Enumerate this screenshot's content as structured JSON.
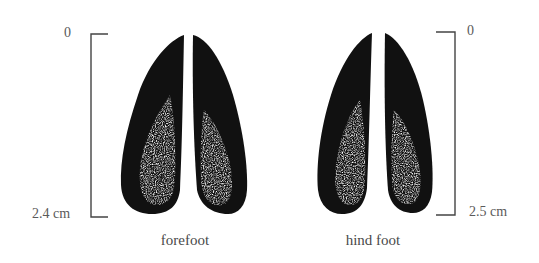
{
  "figure": {
    "forefoot": {
      "caption": "forefoot",
      "scale_top_label": "0",
      "scale_bottom_label": "2.4 cm",
      "length_cm": 2.4
    },
    "hind_foot": {
      "caption": "hind foot",
      "scale_top_label": "0",
      "scale_bottom_label": "2.5 cm",
      "length_cm": 2.5
    },
    "colors": {
      "ink": "#111111",
      "label": "#5a5a5a",
      "bracket": "#444444",
      "background": "#ffffff"
    }
  }
}
